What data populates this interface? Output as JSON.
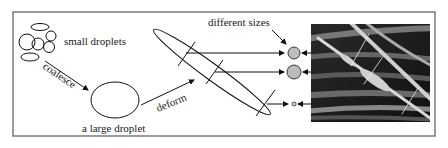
{
  "figure": {
    "labels": {
      "small_droplets": "small droplets",
      "coalesce": "coalesce",
      "large_droplet": "a large droplet",
      "deform": "deform",
      "different_sizes": "different sizes"
    },
    "photo": {
      "description": "SEM micrograph of fibers with spindle-shaped beads"
    },
    "colors": {
      "frame": "#7a7a7a",
      "line": "#111111",
      "bead_fill": "#bdbdbd",
      "photo_bg": "#1a1a1a",
      "fiber": "#cfcfcf"
    }
  }
}
